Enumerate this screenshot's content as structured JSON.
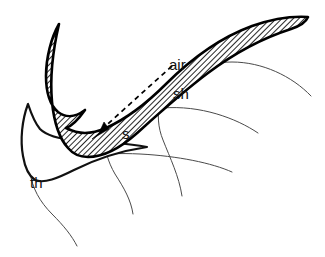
{
  "figure": {
    "type": "articulatory-diagram",
    "width": 325,
    "height": 257,
    "background_color": "#ffffff"
  },
  "labels": {
    "airflow": "air",
    "sh": "sh",
    "s": "s",
    "th": "th"
  },
  "label_positions": {
    "airflow": {
      "x": 169,
      "y": 70
    },
    "sh": {
      "x": 173,
      "y": 99
    },
    "s": {
      "x": 122,
      "y": 139
    },
    "th": {
      "x": 30,
      "y": 188
    }
  },
  "colors": {
    "outline": "#000000",
    "hatch": "#000000",
    "thin_contour": "#4a4a4a",
    "fill": "#ffffff",
    "label": "#111111"
  },
  "annotations": {
    "airflow_arrow": "dashed arrow pointing from upper right to the constriction at lower left",
    "hatched_region": "palate and velum, diagonal hatch fill",
    "thin_curves": "alternative tongue contours for s, sh and th"
  },
  "icons": {
    "arrow": "arrow-head-icon"
  }
}
